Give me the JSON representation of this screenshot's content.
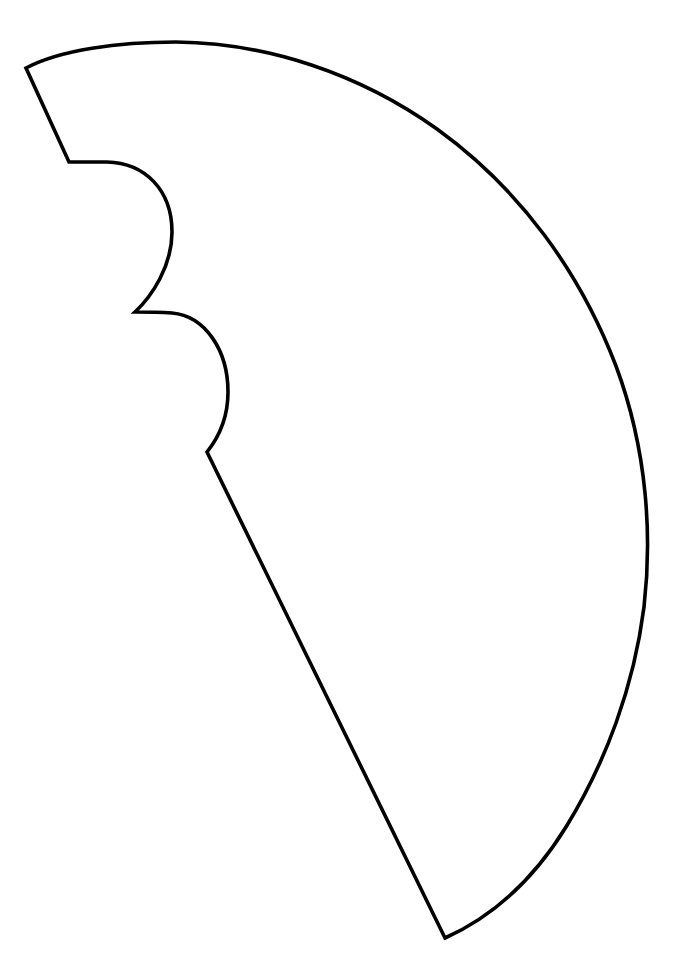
{
  "page": {
    "width": 678,
    "height": 964,
    "background_color": "#ffffff"
  },
  "drawing": {
    "kind": "line-art-outline",
    "stroke_color": "#000000",
    "stroke_width": 3.6,
    "fill_color": "none",
    "closed": true,
    "named_features": [
      "outer-arc",
      "top-left-straight-edge",
      "scallop-bump-upper",
      "scallop-bump-lower",
      "lower-left-straight-edge",
      "bottom-apex"
    ],
    "vertices": {
      "top_left_corner": [
        26,
        68
      ],
      "notch_start": [
        69,
        162
      ],
      "cusp_between_bumps": [
        135,
        312
      ],
      "cusp_below_lower_bump": [
        207,
        452
      ],
      "bottom_apex": [
        445,
        938
      ]
    },
    "extrema": {
      "arc_top_peak": [
        175,
        42
      ],
      "arc_right_max": [
        646,
        570
      ],
      "bump_upper_right_max": [
        172,
        230
      ],
      "bump_lower_right_max": [
        228,
        390
      ]
    },
    "path_d": "M 26 68 C 60 50 118 42 176 42 C 268 43 360 74 437 129 C 520 189 580 272 616 366 C 648 452 652 538 644 607 C 634 686 606 762 566 827 C 532 882 492 917 445 938 L 207 452 C 219 437 228 416 228 392 C 228 350 205 316 172 313 C 157 312 144 312 135 312 C 152 296 172 266 172 232 C 172 190 145 163 107 162 C 92 162 78 162 69 162 L 26 68 Z"
  }
}
